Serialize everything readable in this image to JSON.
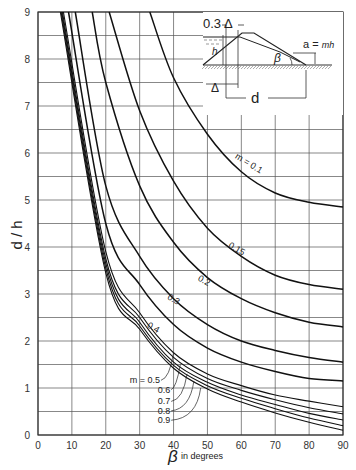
{
  "chart_data": {
    "type": "line",
    "title": "",
    "xlabel": "β in degrees",
    "xlabel_symbol": "β",
    "xlabel_unit": "in degrees",
    "ylabel": "d / h",
    "xlim": [
      0,
      90
    ],
    "ylim": [
      0,
      9
    ],
    "xticks": [
      0,
      10,
      20,
      30,
      40,
      50,
      60,
      70,
      80,
      90
    ],
    "yticks": [
      0,
      1,
      2,
      3,
      4,
      5,
      6,
      7,
      8,
      9
    ],
    "grid": true,
    "grid_minor_y": 0.5,
    "legend": "inline curve labels",
    "series": [
      {
        "name": "m = 0.1",
        "label": "m = 0.1",
        "x": [
          33,
          40,
          50,
          60,
          70,
          80,
          90
        ],
        "y": [
          9.0,
          7.6,
          6.4,
          5.6,
          5.15,
          4.95,
          4.85
        ]
      },
      {
        "name": "0.15",
        "label": "0.15",
        "x": [
          21,
          30,
          40,
          50,
          60,
          70,
          80,
          90
        ],
        "y": [
          9.0,
          6.9,
          5.4,
          4.4,
          3.8,
          3.4,
          3.2,
          3.1
        ]
      },
      {
        "name": "0.2",
        "label": "0.2",
        "x": [
          16,
          20,
          30,
          40,
          50,
          60,
          70,
          80,
          90
        ],
        "y": [
          9.0,
          7.5,
          5.3,
          4.1,
          3.35,
          2.9,
          2.6,
          2.4,
          2.3
        ]
      },
      {
        "name": "0.3",
        "label": "0.3",
        "x": [
          11,
          20,
          30,
          40,
          50,
          60,
          70,
          80,
          90
        ],
        "y": [
          9.0,
          5.3,
          3.8,
          2.9,
          2.35,
          2.0,
          1.8,
          1.65,
          1.55
        ]
      },
      {
        "name": "0.4",
        "label": "0.4",
        "x": [
          9,
          20,
          30,
          40,
          50,
          60,
          70,
          80,
          90
        ],
        "y": [
          9.0,
          4.5,
          3.2,
          2.35,
          1.85,
          1.55,
          1.35,
          1.2,
          1.15
        ]
      },
      {
        "name": "m = 0.5",
        "label": "m = 0.5",
        "x": [
          7.5,
          20,
          30,
          40,
          50,
          60,
          70,
          80,
          90
        ],
        "y": [
          9.0,
          3.9,
          2.6,
          1.75,
          1.3,
          1.05,
          0.85,
          0.72,
          0.6
        ]
      },
      {
        "name": "0.6",
        "label": "0.6",
        "x": [
          7.2,
          20,
          30,
          40,
          50,
          60,
          70,
          80,
          90
        ],
        "y": [
          9.0,
          3.75,
          2.5,
          1.65,
          1.2,
          0.95,
          0.75,
          0.58,
          0.45
        ]
      },
      {
        "name": "0.7",
        "label": "0.7",
        "x": [
          7.0,
          20,
          30,
          40,
          50,
          60,
          70,
          80,
          90
        ],
        "y": [
          9.0,
          3.65,
          2.4,
          1.55,
          1.12,
          0.85,
          0.65,
          0.46,
          0.32
        ]
      },
      {
        "name": "0.8",
        "label": "0.8",
        "x": [
          6.8,
          20,
          30,
          40,
          50,
          60,
          70,
          80,
          90
        ],
        "y": [
          9.0,
          3.55,
          2.32,
          1.48,
          1.05,
          0.78,
          0.56,
          0.36,
          0.2
        ]
      },
      {
        "name": "0.9",
        "label": "0.9",
        "x": [
          6.6,
          20,
          30,
          40,
          50,
          60,
          70,
          80,
          90
        ],
        "y": [
          9.0,
          3.45,
          2.25,
          1.42,
          0.98,
          0.7,
          0.47,
          0.27,
          0.1
        ]
      }
    ],
    "annotations": [
      {
        "text": "m = 0.1",
        "at": [
          58,
          5.9
        ]
      },
      {
        "text": "0.15",
        "at": [
          56,
          4.0
        ]
      },
      {
        "text": "0.2",
        "at": [
          47,
          3.3
        ]
      },
      {
        "text": "0.3",
        "at": [
          38,
          2.9
        ]
      },
      {
        "text": "0.4",
        "at": [
          32,
          2.3
        ]
      },
      {
        "text": "m = 0.5",
        "at": [
          36,
          1.1
        ]
      },
      {
        "text": "0.6",
        "at": [
          39,
          0.9
        ]
      },
      {
        "text": "0.7",
        "at": [
          39,
          0.65
        ]
      },
      {
        "text": "0.8",
        "at": [
          39,
          0.45
        ]
      },
      {
        "text": "0.9",
        "at": [
          39,
          0.25
        ]
      }
    ],
    "inset_diagram": {
      "labels": [
        "0.3 Δ",
        "h",
        "Δ",
        "d",
        "β",
        "a = mh"
      ]
    }
  }
}
